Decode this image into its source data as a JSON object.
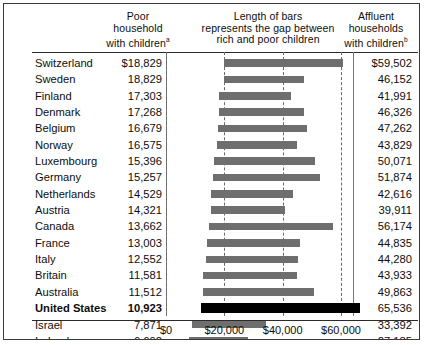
{
  "header": {
    "poor_col": "Poor household with children",
    "poor_col_lines": [
      "Poor",
      "household",
      "with children"
    ],
    "poor_superscript": "a",
    "middle_col_lines": [
      "Length of bars",
      "represents the gap between",
      "rich and poor children"
    ],
    "affluent_col_lines": [
      "Affluent",
      "households",
      "with children"
    ],
    "affluent_superscript": "b"
  },
  "axis": {
    "ticks": [
      "$0",
      "$20,000",
      "$40,000",
      "$60,000"
    ],
    "tick_values": [
      0,
      20000,
      40000,
      60000
    ]
  },
  "colors": {
    "bar": "#6e6e6e",
    "bar_highlight": "#000000",
    "gridline": "#6a6a6a",
    "rule": "#2a2a2a",
    "frame": "#3a3a3a",
    "text": "#0d0d0d"
  },
  "chart_data": {
    "type": "bar",
    "title": "Length of bars represents the gap between rich and poor children",
    "xlabel": "",
    "ylabel": "",
    "xlim": [
      0,
      70000
    ],
    "grid": true,
    "orientation": "horizontal",
    "bar_style": "range",
    "categories": [
      "Switzerland",
      "Sweden",
      "Finland",
      "Denmark",
      "Belgium",
      "Norway",
      "Luxembourg",
      "Germany",
      "Netherlands",
      "Austria",
      "Canada",
      "France",
      "Italy",
      "Britain",
      "Australia",
      "United States",
      "Israel",
      "Ireland"
    ],
    "series": [
      {
        "name": "Poor household with children",
        "values": [
          18829,
          18829,
          17303,
          17268,
          16679,
          16575,
          15396,
          15257,
          14529,
          14321,
          13662,
          13003,
          12552,
          11581,
          11512,
          10923,
          7871,
          6692
        ]
      },
      {
        "name": "Affluent households with children",
        "values": [
          59502,
          46152,
          41991,
          46326,
          47262,
          43829,
          50071,
          51874,
          42616,
          39911,
          56174,
          44835,
          44280,
          43933,
          49863,
          65536,
          33392,
          27185
        ]
      }
    ],
    "rows": [
      {
        "country": "Switzerland",
        "poor": 18829,
        "poor_label": "$18,829",
        "affluent": 59502,
        "affluent_label": "$59,502",
        "highlight": false
      },
      {
        "country": "Sweden",
        "poor": 18829,
        "poor_label": "18,829",
        "affluent": 46152,
        "affluent_label": "46,152",
        "highlight": false
      },
      {
        "country": "Finland",
        "poor": 17303,
        "poor_label": "17,303",
        "affluent": 41991,
        "affluent_label": "41,991",
        "highlight": false
      },
      {
        "country": "Denmark",
        "poor": 17268,
        "poor_label": "17,268",
        "affluent": 46326,
        "affluent_label": "46,326",
        "highlight": false
      },
      {
        "country": "Belgium",
        "poor": 16679,
        "poor_label": "16,679",
        "affluent": 47262,
        "affluent_label": "47,262",
        "highlight": false
      },
      {
        "country": "Norway",
        "poor": 16575,
        "poor_label": "16,575",
        "affluent": 43829,
        "affluent_label": "43,829",
        "highlight": false
      },
      {
        "country": "Luxembourg",
        "poor": 15396,
        "poor_label": "15,396",
        "affluent": 50071,
        "affluent_label": "50,071",
        "highlight": false
      },
      {
        "country": "Germany",
        "poor": 15257,
        "poor_label": "15,257",
        "affluent": 51874,
        "affluent_label": "51,874",
        "highlight": false
      },
      {
        "country": "Netherlands",
        "poor": 14529,
        "poor_label": "14,529",
        "affluent": 42616,
        "affluent_label": "42,616",
        "highlight": false
      },
      {
        "country": "Austria",
        "poor": 14321,
        "poor_label": "14,321",
        "affluent": 39911,
        "affluent_label": "39,911",
        "highlight": false
      },
      {
        "country": "Canada",
        "poor": 13662,
        "poor_label": "13,662",
        "affluent": 56174,
        "affluent_label": "56,174",
        "highlight": false
      },
      {
        "country": "France",
        "poor": 13003,
        "poor_label": "13,003",
        "affluent": 44835,
        "affluent_label": "44,835",
        "highlight": false
      },
      {
        "country": "Italy",
        "poor": 12552,
        "poor_label": "12,552",
        "affluent": 44280,
        "affluent_label": "44,280",
        "highlight": false
      },
      {
        "country": "Britain",
        "poor": 11581,
        "poor_label": "11,581",
        "affluent": 43933,
        "affluent_label": "43,933",
        "highlight": false
      },
      {
        "country": "Australia",
        "poor": 11512,
        "poor_label": "11,512",
        "affluent": 49863,
        "affluent_label": "49,863",
        "highlight": false
      },
      {
        "country": "United States",
        "poor": 10923,
        "poor_label": "10,923",
        "affluent": 65536,
        "affluent_label": "65,536",
        "highlight": true
      },
      {
        "country": "Israel",
        "poor": 7871,
        "poor_label": "7,871",
        "affluent": 33392,
        "affluent_label": "33,392",
        "highlight": false
      },
      {
        "country": "Ireland",
        "poor": 6692,
        "poor_label": "6,692",
        "affluent": 27185,
        "affluent_label": "27,185",
        "highlight": false
      }
    ]
  }
}
